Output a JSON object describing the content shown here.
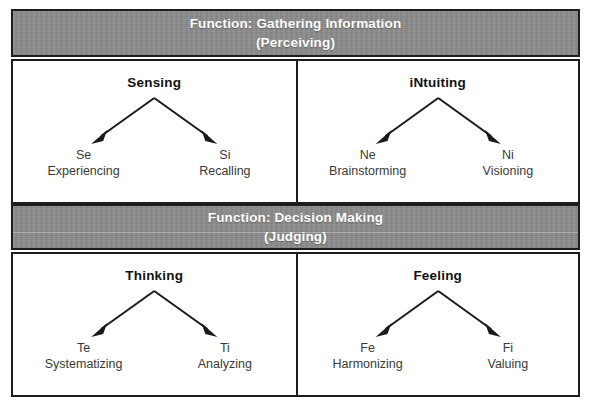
{
  "diagram": {
    "sections": [
      {
        "band": {
          "line1": "Function: Gathering Information",
          "line2": "(Perceiving)"
        },
        "quadrants": [
          {
            "title": "Sensing",
            "leaves": [
              {
                "code": "Se",
                "desc": "Experiencing"
              },
              {
                "code": "Si",
                "desc": "Recalling"
              }
            ]
          },
          {
            "title": "iNtuiting",
            "leaves": [
              {
                "code": "Ne",
                "desc": "Brainstorming"
              },
              {
                "code": "Ni",
                "desc": "Visioning"
              }
            ]
          }
        ]
      },
      {
        "band": {
          "line1": "Function: Decision Making",
          "line2": "(Judging)"
        },
        "quadrants": [
          {
            "title": "Thinking",
            "leaves": [
              {
                "code": "Te",
                "desc": "Systematizing"
              },
              {
                "code": "Ti",
                "desc": "Analyzing"
              }
            ]
          },
          {
            "title": "Feeling",
            "leaves": [
              {
                "code": "Fe",
                "desc": "Harmonizing"
              },
              {
                "code": "Fi",
                "desc": "Valuing"
              }
            ]
          }
        ]
      }
    ]
  },
  "colors": {
    "band_background": "#8c8c8c",
    "band_text": "#ffffff",
    "border": "#1d1d1d",
    "quadrant_background": "#ffffff",
    "title_text": "#111111",
    "leaf_text": "#3a3a3a",
    "arrow": "#1a1a1a"
  }
}
